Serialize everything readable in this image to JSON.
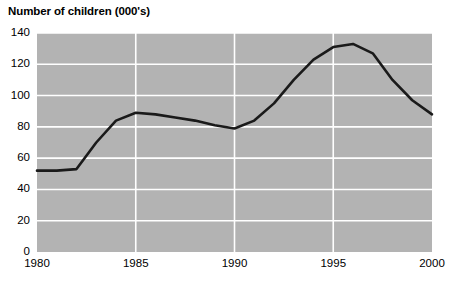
{
  "chart_data": {
    "type": "line",
    "title": "Number of children (000's)",
    "xlabel": "",
    "ylabel": "",
    "xlim": [
      1980,
      2000
    ],
    "ylim": [
      0,
      140
    ],
    "xticks": [
      "1980",
      "1985",
      "1990",
      "1995",
      "2000"
    ],
    "yticks": [
      "0",
      "20",
      "40",
      "60",
      "80",
      "100",
      "120",
      "140"
    ],
    "grid": true,
    "legend": "none",
    "plot_background": "#b3b3b3",
    "gridline_color": "#ffffff",
    "line_color": "#1a1a1a",
    "line_width": 2.6,
    "x": [
      1980,
      1981,
      1982,
      1983,
      1984,
      1985,
      1986,
      1987,
      1988,
      1989,
      1990,
      1991,
      1992,
      1993,
      1994,
      1995,
      1996,
      1997,
      1998,
      1999,
      2000
    ],
    "values": [
      52,
      52,
      53,
      70,
      84,
      89,
      88,
      86,
      84,
      81,
      79,
      84,
      95,
      110,
      123,
      131,
      133,
      127,
      110,
      97,
      88
    ],
    "series": [
      {
        "name": "Number of children",
        "values": [
          52,
          52,
          53,
          70,
          84,
          89,
          88,
          86,
          84,
          81,
          79,
          84,
          95,
          110,
          123,
          131,
          133,
          127,
          110,
          97,
          88
        ]
      }
    ],
    "annotations": []
  },
  "axis": {
    "y_tick_labels": [
      "140",
      "120",
      "100",
      "80",
      "60",
      "40",
      "20",
      "0"
    ],
    "x_tick_labels": [
      "1980",
      "1985",
      "1990",
      "1995",
      "2000"
    ]
  }
}
